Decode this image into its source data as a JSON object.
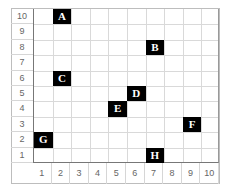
{
  "grid": {
    "columns": 10,
    "rows": 10,
    "x_labels": [
      "1",
      "2",
      "3",
      "4",
      "5",
      "6",
      "7",
      "8",
      "9",
      "10"
    ],
    "y_labels": [
      "10",
      "9",
      "8",
      "7",
      "6",
      "5",
      "4",
      "3",
      "2",
      "1"
    ],
    "colors": {
      "marker_bg": "#000000",
      "marker_text": "#ffffff",
      "grid_line": "#d9d9d9",
      "axis_line": "#777777"
    }
  },
  "points": [
    {
      "label": "A",
      "x": 2,
      "y": 10
    },
    {
      "label": "B",
      "x": 7,
      "y": 8
    },
    {
      "label": "C",
      "x": 2,
      "y": 6
    },
    {
      "label": "D",
      "x": 6,
      "y": 5
    },
    {
      "label": "E",
      "x": 5,
      "y": 4
    },
    {
      "label": "F",
      "x": 9,
      "y": 3
    },
    {
      "label": "G",
      "x": 1,
      "y": 2
    },
    {
      "label": "H",
      "x": 7,
      "y": 1
    }
  ]
}
